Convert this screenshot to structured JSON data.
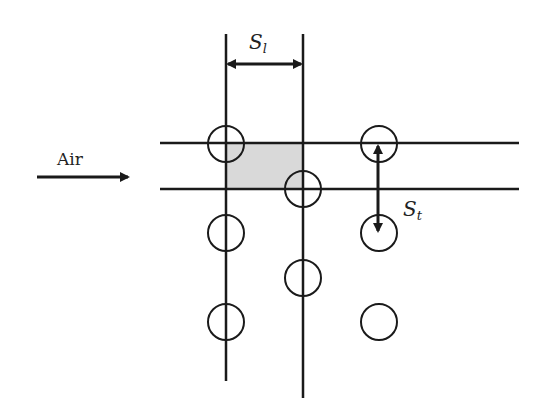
{
  "diagram": {
    "type": "staggered tube bank schematic",
    "flow_label": "Air",
    "longitudinal_pitch": {
      "symbol": "S",
      "subscript": "l"
    },
    "transverse_pitch": {
      "symbol": "S",
      "subscript": "t"
    },
    "colors": {
      "stroke": "#1a1a1a",
      "shaded_cell": "#d9d9d9"
    },
    "tubes": [
      {
        "cx": 226,
        "cy": 144
      },
      {
        "cx": 303,
        "cy": 189
      },
      {
        "cx": 379,
        "cy": 144
      },
      {
        "cx": 226,
        "cy": 233
      },
      {
        "cx": 303,
        "cy": 278
      },
      {
        "cx": 379,
        "cy": 233
      },
      {
        "cx": 226,
        "cy": 322
      },
      {
        "cx": 379,
        "cy": 322
      }
    ],
    "tube_radius": 18
  }
}
